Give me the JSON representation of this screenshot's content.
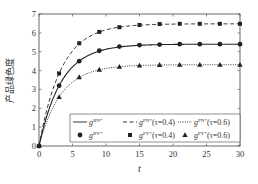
{
  "chart_data": {
    "type": "line",
    "title": "",
    "xlabel": "t",
    "ylabel": "产品绿色度",
    "xlim": [
      0,
      30
    ],
    "ylim": [
      0,
      7
    ],
    "xticks": [
      0,
      5,
      10,
      15,
      20,
      25,
      30
    ],
    "yticks": [
      0,
      1,
      2,
      3,
      4,
      5,
      6,
      7
    ],
    "grid": false,
    "legend_position": "lower right (inside)",
    "x": [
      0,
      3,
      6,
      9,
      12,
      15,
      18,
      21,
      24,
      27,
      30
    ],
    "series": [
      {
        "name": "g^{BN*} / g^{BY*}",
        "legend_line": "g^{BN*}",
        "legend_marker": "g^{BY*}",
        "line_style": "solid",
        "marker": "circle",
        "values": [
          0,
          3.2,
          4.5,
          5.05,
          5.27,
          5.35,
          5.38,
          5.4,
          5.4,
          5.4,
          5.4
        ]
      },
      {
        "name": "g^{PN*}(τ=0.4) / g^{PY*}(τ=0.4)",
        "legend_line": "g^{PN*}(τ=0.4)",
        "legend_marker": "g^{PY*}(τ=0.4)",
        "line_style": "dashed",
        "marker": "square",
        "values": [
          0,
          3.85,
          5.45,
          6.05,
          6.3,
          6.42,
          6.47,
          6.48,
          6.48,
          6.48,
          6.48
        ]
      },
      {
        "name": "g^{PN*}(τ=0.6) / g^{PY*}(τ=0.6)",
        "legend_line": "g^{PN*}(τ=0.6)",
        "legend_marker": "g^{PY*}(τ=0.6)",
        "line_style": "dotted",
        "marker": "triangle",
        "values": [
          0,
          2.6,
          3.65,
          4.05,
          4.2,
          4.27,
          4.3,
          4.31,
          4.31,
          4.31,
          4.31
        ]
      }
    ]
  },
  "legend": {
    "row1": [
      {
        "base": "g",
        "sup": "BN*",
        "suffix": ""
      },
      {
        "base": "g",
        "sup": "PN*",
        "suffix": "(τ=0.4)"
      },
      {
        "base": "g",
        "sup": "PN*",
        "suffix": "(τ=0.6)"
      }
    ],
    "row2": [
      {
        "base": "g",
        "sup": "BY*",
        "suffix": ""
      },
      {
        "base": "g",
        "sup": "PY*",
        "suffix": "(τ=0.4)"
      },
      {
        "base": "g",
        "sup": "PY*",
        "suffix": "(τ=0.6)"
      }
    ]
  },
  "colors": {
    "line": "#222222",
    "axis": "#444444",
    "text": "#333333"
  }
}
